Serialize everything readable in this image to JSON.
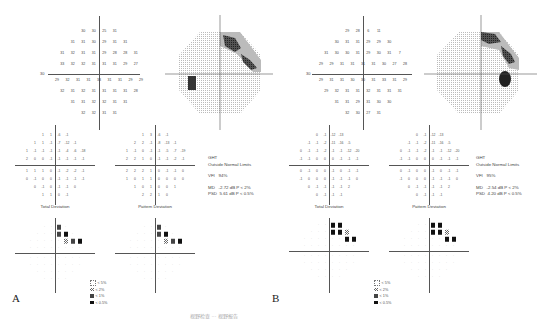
{
  "figure": {
    "caption": "视野检查 ··· 视野报告",
    "panels": [
      {
        "letter": "A",
        "threshold_grid": {
          "axis_label_left": "30",
          "axis_label_right": "30",
          "rows": [
            [
              "30",
              "30",
              "25",
              "31"
            ],
            [
              "31",
              "31",
              "30",
              "29",
              "31",
              "31"
            ],
            [
              "31",
              "32",
              "31",
              "31",
              "29",
              "28",
              "28",
              "31"
            ],
            [
              "33",
              "32",
              "32",
              "31",
              "31",
              "31",
              "29",
              "27"
            ],
            [
              "29",
              "32",
              "31",
              "31",
              "33",
              "31",
              "31",
              "29",
              "29"
            ],
            [
              "32",
              "31",
              "32",
              "31",
              "31",
              "31",
              "31",
              "28"
            ],
            [
              "31",
              "31",
              "32",
              "32",
              "31",
              "31"
            ],
            [
              "32",
              "32",
              "31",
              "31"
            ]
          ]
        },
        "greyscale": {
          "defect_upper_right": "arcuate scotoma",
          "blind_spot": "left"
        },
        "total_deviation": {
          "title": "Total Deviation",
          "rows": [
            [
              "1",
              "1",
              "-6",
              "-1"
            ],
            [
              "1",
              "1",
              "-1",
              "-7",
              "-12",
              "-1"
            ],
            [
              "1",
              "-1",
              "-1",
              "-1",
              "-1",
              "-4",
              "-6",
              "-18"
            ],
            [
              "2",
              "0",
              "0",
              "-1",
              "-1",
              "-1",
              "-1",
              "-1"
            ],
            [
              "1",
              "1",
              "1",
              "0",
              "-1",
              "-2",
              "-2",
              "-1"
            ],
            [
              "0",
              "-1",
              "0",
              "0",
              "-1",
              "-1",
              "-1",
              "-1"
            ],
            [
              "0",
              "-1",
              "0",
              "-1",
              "-1",
              "0"
            ],
            [
              "1",
              "1",
              "0",
              "-1"
            ]
          ]
        },
        "pattern_deviation": {
          "title": "Pattern Deviation",
          "rows": [
            [
              "1",
              "3",
              "-6",
              "-1"
            ],
            [
              "2",
              "2",
              "-1",
              "-8",
              "-13",
              "-1"
            ],
            [
              "1",
              "-1",
              "0",
              "-1",
              "-1",
              "-5",
              "-7",
              "-19"
            ],
            [
              "2",
              "2",
              "1",
              "0",
              "-1",
              "-1",
              "-2",
              "-1"
            ],
            [
              "2",
              "2",
              "2",
              "1",
              "0",
              "-1",
              "-1",
              "0"
            ],
            [
              "1",
              "0",
              "1",
              "1",
              "0",
              "0",
              "0",
              "0"
            ],
            [
              "1",
              "0",
              "1",
              "0",
              "0",
              "1"
            ],
            [
              "2",
              "2",
              "1",
              "0"
            ]
          ]
        },
        "stats": {
          "ght_label": "GHT",
          "ght_value": "Outside Normal Limits",
          "vfi_label": "VFI",
          "vfi_value": "94%",
          "md_label": "MD",
          "md_value": "-2.72 dB",
          "md_p": "P < 2%",
          "psd_label": "PSD",
          "psd_value": "5.61 dB",
          "psd_p": "P < 0.5%"
        },
        "legend": [
          {
            "symbol": "dot-square",
            "label": "< 5%"
          },
          {
            "symbol": "hatched",
            "label": "< 2%"
          },
          {
            "symbol": "checker",
            "label": "< 1%"
          },
          {
            "symbol": "solid",
            "label": "< 0.5%"
          }
        ]
      },
      {
        "letter": "B",
        "threshold_grid": {
          "axis_label_left": "30",
          "axis_label_right": "30",
          "rows": [
            [
              "29",
              "28",
              "6",
              "11"
            ],
            [
              "30",
              "31",
              "31",
              "29",
              "29",
              "30"
            ],
            [
              "31",
              "30",
              "30",
              "31",
              "29",
              "30",
              "31",
              "7"
            ],
            [
              "29",
              "29",
              "31",
              "31",
              "31",
              "31",
              "30",
              "27",
              "28"
            ],
            [
              "29",
              "31",
              "31",
              "30",
              "30",
              "31",
              "33",
              "31",
              "29"
            ],
            [
              "29",
              "32",
              "31",
              "31",
              "32",
              "31",
              "31",
              "31"
            ],
            [
              "31",
              "31",
              "29",
              "31",
              "30",
              "30"
            ],
            [
              "32",
              "30",
              "27",
              "31"
            ]
          ]
        },
        "greyscale": {
          "defect_upper_right": "superior arcuate",
          "blind_spot": "right"
        },
        "total_deviation": {
          "title": "Total Deviation",
          "rows": [
            [
              "0",
              "-1",
              "-12",
              "-13"
            ],
            [
              "-1",
              "-1",
              "-2",
              "-11",
              "-16",
              "-5"
            ],
            [
              "0",
              "-1",
              "-1",
              "-2",
              "-1",
              "-1",
              "-12",
              "-20"
            ],
            [
              "-1",
              "-1",
              "0",
              "0",
              "0",
              "-1",
              "-1",
              "-1"
            ],
            [
              "0",
              "-1",
              "0",
              "0",
              "-1",
              "0",
              "-1",
              "-1"
            ],
            [
              "-1",
              "0",
              "0",
              "0",
              "-1",
              "-1",
              "-1",
              "0"
            ],
            [
              "0",
              "-1",
              "-1",
              "-1",
              "-1",
              "2"
            ],
            [
              "0",
              "-1",
              "-1",
              "-1"
            ]
          ]
        },
        "pattern_deviation": {
          "title": "Pattern Deviation",
          "rows": [
            [
              "0",
              "-1",
              "-12",
              "-13"
            ],
            [
              "-1",
              "-1",
              "-2",
              "-11",
              "-16",
              "-5"
            ],
            [
              "0",
              "-1",
              "-1",
              "-2",
              "-1",
              "-1",
              "-12",
              "-20"
            ],
            [
              "-1",
              "-1",
              "0",
              "0",
              "0",
              "-1",
              "-1",
              "-1"
            ],
            [
              "0",
              "-1",
              "0",
              "0",
              "-1",
              "0",
              "-1",
              "-1"
            ],
            [
              "-1",
              "0",
              "0",
              "0",
              "-1",
              "-1",
              "-1",
              "0"
            ],
            [
              "0",
              "-1",
              "-1",
              "-1",
              "-1",
              "2"
            ],
            [
              "0",
              "-1",
              "-1",
              "-1"
            ]
          ]
        },
        "stats": {
          "ght_label": "GHT",
          "ght_value": "Outside Normal Limits",
          "vfi_label": "VFI",
          "vfi_value": "95%",
          "md_label": "MD",
          "md_value": "-2.54 dB",
          "md_p": "P < 2%",
          "psd_label": "PSD",
          "psd_value": "4.20 dB",
          "psd_p": "P < 0.5%"
        },
        "legend": [
          {
            "symbol": "dot-square",
            "label": "< 5%"
          },
          {
            "symbol": "hatched",
            "label": "< 2%"
          },
          {
            "symbol": "checker",
            "label": "< 1%"
          },
          {
            "symbol": "solid",
            "label": "< 0.5%"
          }
        ]
      }
    ]
  }
}
